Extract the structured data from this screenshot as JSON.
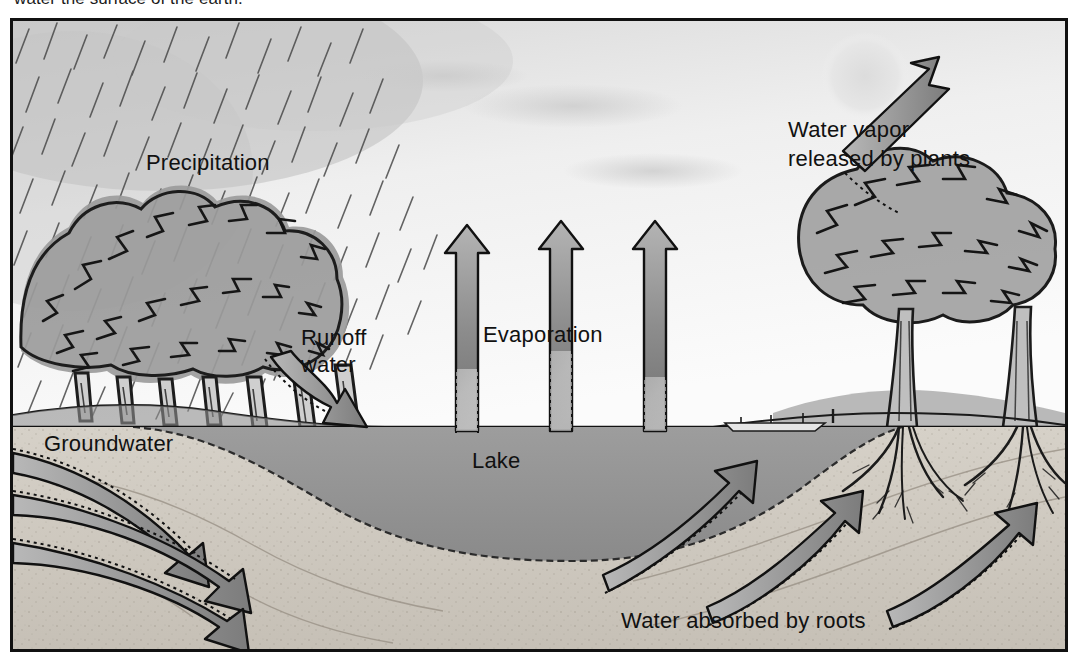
{
  "caption": "water the surface of the earth.",
  "figure": {
    "frame_border_color": "#111111",
    "sky_color": "#f0f0f0",
    "lake_color": "#9a9a9a",
    "soil_color": "#cfcac2",
    "arrow_fill": "#8e8e8e",
    "arrow_outline": "#111111",
    "sun_color": "#e2e2e2"
  },
  "labels": {
    "precipitation": "Precipitation",
    "water_vapor_line1": "Water vapor",
    "water_vapor_line2": "released by plants",
    "runoff_line1": "Runoff",
    "runoff_line2": "water",
    "evaporation": "Evaporation",
    "groundwater": "Groundwater",
    "lake": "Lake",
    "roots": "Water absorbed by roots"
  },
  "elements": {
    "sun": "sun-disc",
    "rain": "rain-streaks",
    "tree_grove_left": "deciduous-tree-grove",
    "trees_right": "two-large-trees-with-roots",
    "boat": "small-boat-at-shore",
    "evaporation_arrows": 3,
    "groundwater_arrows": 3,
    "root_uptake_arrows": 3,
    "runoff_arrows": 1,
    "transpiration_arrows": 1
  }
}
